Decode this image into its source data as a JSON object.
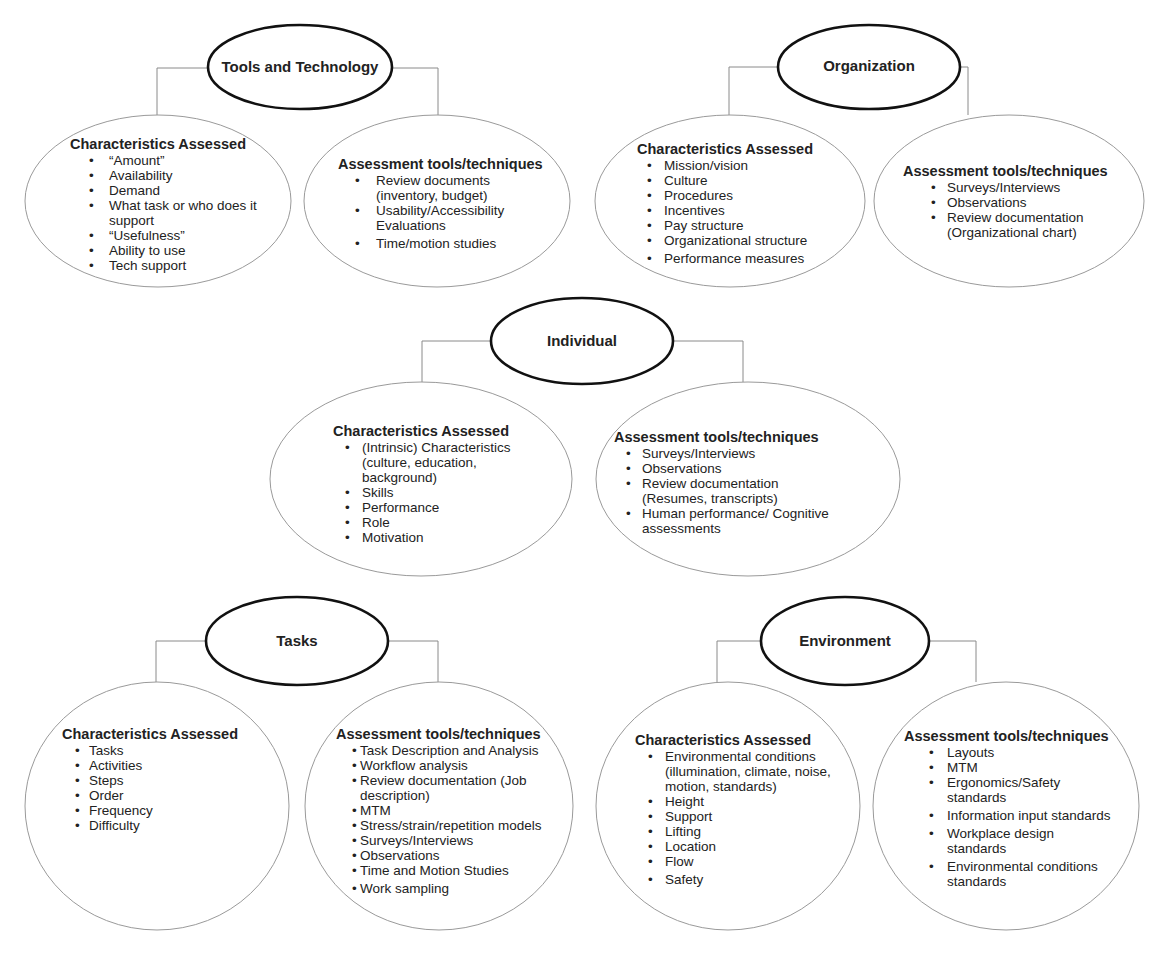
{
  "diagram": {
    "groups": [
      {
        "id": "tools-and-technology",
        "title": "Tools and Technology",
        "characteristics": {
          "title": "Characteristics Assessed",
          "items": [
            "“Amount”",
            "Availability",
            "Demand",
            "What task or who does it\n support",
            "“Usefulness”",
            "Ability to use",
            "Tech support"
          ]
        },
        "assessment": {
          "title": "Assessment tools/techniques",
          "items": [
            "Review documents\n(inventory, budget)",
            "Usability/Accessibility\nEvaluations",
            "Time/motion studies"
          ]
        }
      },
      {
        "id": "organization",
        "title": "Organization",
        "characteristics": {
          "title": "Characteristics Assessed",
          "items": [
            "Mission/vision",
            "Culture",
            "Procedures",
            "Incentives",
            "Pay structure",
            "Organizational structure",
            "Performance measures"
          ]
        },
        "assessment": {
          "title": "Assessment tools/techniques",
          "items": [
            "Surveys/Interviews",
            "Observations",
            "Review documentation\n (Organizational chart)"
          ]
        }
      },
      {
        "id": "individual",
        "title": "Individual",
        "characteristics": {
          "title": "Characteristics Assessed",
          "items": [
            "(Intrinsic) Characteristics\n  (culture, education,\n background)",
            "Skills",
            "Performance",
            "Role",
            "Motivation"
          ]
        },
        "assessment": {
          "title": "Assessment tools/techniques",
          "items": [
            "Surveys/Interviews",
            "Observations",
            "Review documentation\n(Resumes, transcripts)",
            "Human performance/ Cognitive\nassessments"
          ]
        }
      },
      {
        "id": "tasks",
        "title": "Tasks",
        "characteristics": {
          "title": "Characteristics Assessed",
          "items": [
            "Tasks",
            "Activities",
            "Steps",
            "Order",
            "Frequency",
            "Difficulty"
          ]
        },
        "assessment": {
          "title": "Assessment tools/techniques",
          "items": [
            "Task Description and Analysis",
            "Workflow analysis",
            "Review documentation (Job\n description)",
            "MTM",
            "Stress/strain/repetition models",
            "Surveys/Interviews",
            "Observations",
            "Time and Motion Studies",
            "Work sampling"
          ]
        }
      },
      {
        "id": "environment",
        "title": "Environment",
        "characteristics": {
          "title": "Characteristics Assessed",
          "items": [
            "Environmental conditions\n(illumination, climate, noise,\nmotion, standards)",
            "Height",
            "Support",
            "Lifting",
            "Location",
            "Flow",
            "Safety"
          ]
        },
        "assessment": {
          "title": "Assessment tools/techniques",
          "items": [
            "Layouts",
            "MTM",
            "Ergonomics/Safety\nstandards",
            "Information input standards",
            "Workplace design\nstandards",
            "Environmental conditions\nstandards"
          ]
        }
      }
    ]
  },
  "colors": {
    "header_stroke": "#111111",
    "child_stroke": "#9a9a9a",
    "connector_stroke": "#8a8a8a",
    "text": "#222222"
  }
}
